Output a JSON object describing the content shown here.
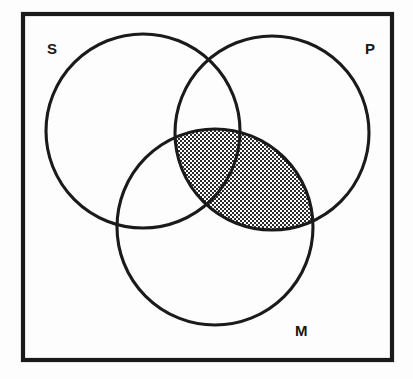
{
  "diagram": {
    "kind": "venn-diagram",
    "universe": {
      "shape": "rectangle",
      "x": 23,
      "y": 14,
      "width": 369,
      "height": 346,
      "stroke_color": "#1a1a1a",
      "fill_color": "#ffffff"
    },
    "background_color": "#fdfdfd",
    "stroke_color": "#1a1a1a",
    "shade_color": "#3a3a3a",
    "shade_fill": "#cfcfcf",
    "circles": [
      {
        "id": "S",
        "label": "S",
        "cx": 143,
        "cy": 131,
        "r": 97,
        "label_x": 47,
        "label_y": 54
      },
      {
        "id": "P",
        "label": "P",
        "cx": 272,
        "cy": 133,
        "r": 97,
        "label_x": 365,
        "label_y": 54
      },
      {
        "id": "M",
        "label": "M",
        "cx": 215,
        "cy": 227,
        "r": 98,
        "label_x": 295,
        "label_y": 336
      }
    ],
    "shaded_regions": [
      {
        "name": "M-and-P-intersection",
        "members": [
          "M",
          "P"
        ],
        "pattern": "stipple-dots",
        "description": "Lens-shaped overlap of circle M and circle P is shaded with a fine dot/stipple pattern"
      }
    ],
    "labels": {
      "subject": "S",
      "predicate": "P",
      "middle": "M"
    }
  }
}
